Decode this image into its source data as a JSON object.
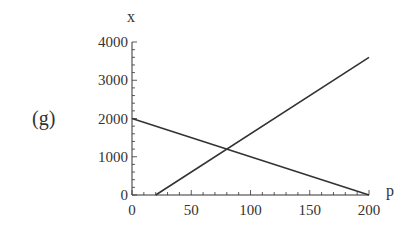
{
  "panel_label": "(g)",
  "chart_data": {
    "type": "line",
    "title": "",
    "xlabel": "p",
    "ylabel": "x",
    "xlim": [
      0,
      200
    ],
    "ylim": [
      0,
      4000
    ],
    "x_major_ticks": [
      0,
      50,
      100,
      150,
      200
    ],
    "x_tick_labels": [
      "0",
      "50",
      "100",
      "150",
      "200"
    ],
    "x_minor_step": 10,
    "y_major_ticks": [
      0,
      1000,
      2000,
      3000,
      4000
    ],
    "y_tick_labels": [
      "0",
      "1000",
      "2000",
      "3000",
      "4000"
    ],
    "y_minor_step": 200,
    "grid": false,
    "legend": "none",
    "series": [
      {
        "name": "decreasing line",
        "x": [
          0,
          200
        ],
        "y": [
          2000,
          0
        ]
      },
      {
        "name": "increasing line",
        "x": [
          20,
          200
        ],
        "y": [
          0,
          3600
        ]
      }
    ],
    "line_color": "#333333"
  }
}
